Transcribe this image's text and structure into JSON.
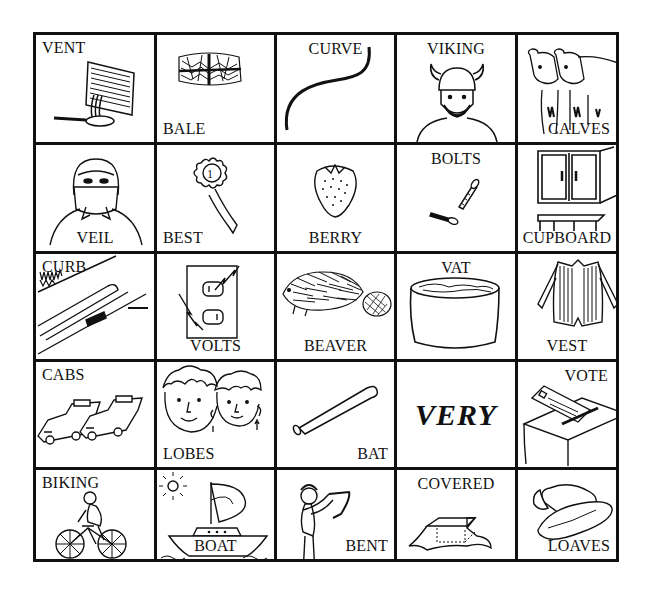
{
  "worksheet": {
    "grid": {
      "rows": 5,
      "columns": 5,
      "cells": [
        {
          "word": "VENT",
          "label_position": "top-left",
          "icon": "vent-and-pan-icon"
        },
        {
          "word": "BALE",
          "label_position": "bottom-left",
          "icon": "hay-bale-icon"
        },
        {
          "word": "CURVE",
          "label_position": "top-center",
          "icon": "curved-line-icon"
        },
        {
          "word": "VIKING",
          "label_position": "top-center",
          "icon": "viking-icon"
        },
        {
          "word": "CALVES",
          "label_position": "bottom-right",
          "icon": "calves-icon"
        },
        {
          "word": "VEIL",
          "label_position": "bottom-center",
          "icon": "veiled-face-icon"
        },
        {
          "word": "BEST",
          "label_position": "bottom-left",
          "icon": "first-place-ribbon-icon"
        },
        {
          "word": "BERRY",
          "label_position": "bottom-center",
          "icon": "strawberry-icon"
        },
        {
          "word": "BOLTS",
          "label_position": "top-center",
          "icon": "bolts-icon"
        },
        {
          "word": "CUPBOARD",
          "label_position": "bottom-center",
          "icon": "cupboard-icon"
        },
        {
          "word": "CURB",
          "label_position": "top-left",
          "icon": "curb-icon"
        },
        {
          "word": "VOLTS",
          "label_position": "bottom-center",
          "icon": "electric-outlet-icon"
        },
        {
          "word": "BEAVER",
          "label_position": "bottom-center",
          "icon": "beaver-icon"
        },
        {
          "word": "VAT",
          "label_position": "top-center",
          "icon": "vat-icon"
        },
        {
          "word": "VEST",
          "label_position": "bottom-center",
          "icon": "vest-icon"
        },
        {
          "word": "CABS",
          "label_position": "top-left",
          "icon": "taxi-cabs-icon"
        },
        {
          "word": "LOBES",
          "label_position": "bottom-left",
          "icon": "ear-lobes-faces-icon"
        },
        {
          "word": "BAT",
          "label_position": "bottom-right",
          "icon": "baseball-bat-icon"
        },
        {
          "word": "VERY",
          "label_position": "center-bold-italic",
          "icon": "none"
        },
        {
          "word": "VOTE",
          "label_position": "top-right",
          "icon": "ballot-box-icon"
        },
        {
          "word": "BIKING",
          "label_position": "top-left",
          "icon": "cyclist-icon"
        },
        {
          "word": "BOAT",
          "label_position": "bottom-center",
          "icon": "sailboat-icon"
        },
        {
          "word": "BENT",
          "label_position": "bottom-right",
          "icon": "bending-stick-icon"
        },
        {
          "word": "COVERED",
          "label_position": "top-center",
          "icon": "covered-box-icon"
        },
        {
          "word": "LOAVES",
          "label_position": "bottom-right",
          "icon": "bread-loaves-icon"
        }
      ]
    },
    "colors": {
      "line": "#111111",
      "background": "#ffffff"
    }
  }
}
